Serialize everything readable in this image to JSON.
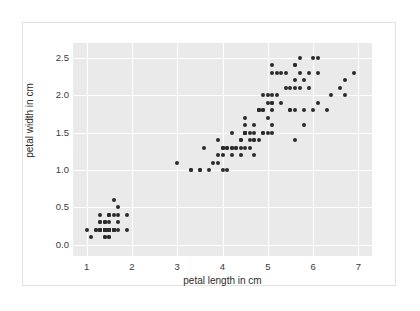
{
  "chart_data": {
    "type": "scatter",
    "title": "",
    "subtitle": "",
    "xlabel": "petal length in cm",
    "ylabel": "petal width in cm",
    "xlim": [
      0.7,
      7.3
    ],
    "ylim": [
      -0.15,
      2.7
    ],
    "xticks": [
      1,
      2,
      3,
      4,
      5,
      6,
      7
    ],
    "xtick_labels": [
      "1",
      "2",
      "3",
      "4",
      "5",
      "6",
      "7"
    ],
    "yticks": [
      0.0,
      0.5,
      1.0,
      1.5,
      2.0,
      2.5
    ],
    "ytick_labels": [
      "0.0",
      "0.5",
      "1.0",
      "1.5",
      "2.0",
      "2.5"
    ],
    "grid": true,
    "grid_color": "#ffffff",
    "plot_background": "#eaeaea",
    "figure_background": "#ffffff",
    "legend": null,
    "legend_position": "none",
    "marker_color": "#2b2b2b",
    "marker_size": 4,
    "marker_shape": "circle",
    "series": [
      {
        "name": "iris petal measurements",
        "x": [
          1.4,
          1.4,
          1.3,
          1.5,
          1.4,
          1.7,
          1.4,
          1.5,
          1.4,
          1.5,
          1.5,
          1.6,
          1.4,
          1.1,
          1.2,
          1.5,
          1.3,
          1.4,
          1.7,
          1.5,
          1.7,
          1.5,
          1.0,
          1.7,
          1.9,
          1.6,
          1.6,
          1.5,
          1.4,
          1.6,
          1.6,
          1.5,
          1.5,
          1.4,
          1.5,
          1.2,
          1.3,
          1.4,
          1.3,
          1.5,
          1.3,
          1.3,
          1.3,
          1.6,
          1.9,
          1.4,
          1.6,
          1.4,
          1.5,
          1.4,
          4.7,
          4.5,
          4.9,
          4.0,
          4.6,
          4.5,
          4.7,
          3.3,
          4.6,
          3.9,
          3.5,
          4.2,
          4.0,
          4.7,
          3.6,
          4.4,
          4.5,
          4.1,
          4.5,
          3.9,
          4.8,
          4.0,
          4.9,
          4.7,
          4.3,
          4.4,
          4.8,
          5.0,
          4.5,
          3.5,
          3.8,
          3.7,
          3.9,
          5.1,
          4.5,
          4.5,
          4.7,
          4.4,
          4.1,
          4.0,
          4.4,
          4.6,
          4.0,
          3.3,
          4.2,
          4.2,
          4.2,
          4.3,
          3.0,
          4.1,
          6.0,
          5.1,
          5.9,
          5.6,
          5.8,
          6.6,
          4.5,
          6.3,
          5.8,
          6.1,
          5.1,
          5.3,
          5.5,
          5.0,
          5.1,
          5.3,
          5.5,
          6.7,
          6.9,
          5.0,
          5.7,
          4.9,
          6.7,
          4.9,
          5.7,
          6.0,
          4.8,
          4.9,
          5.6,
          5.8,
          6.1,
          6.4,
          5.6,
          5.1,
          5.6,
          6.1,
          5.6,
          5.5,
          4.8,
          5.4,
          5.6,
          5.1,
          5.1,
          5.9,
          5.7,
          5.2,
          5.0,
          5.2,
          5.4,
          5.1
        ],
        "y": [
          0.2,
          0.2,
          0.2,
          0.2,
          0.2,
          0.4,
          0.3,
          0.2,
          0.2,
          0.1,
          0.2,
          0.2,
          0.1,
          0.1,
          0.2,
          0.4,
          0.4,
          0.3,
          0.3,
          0.3,
          0.2,
          0.4,
          0.2,
          0.5,
          0.2,
          0.2,
          0.4,
          0.2,
          0.2,
          0.2,
          0.2,
          0.4,
          0.1,
          0.2,
          0.2,
          0.2,
          0.2,
          0.1,
          0.2,
          0.2,
          0.3,
          0.3,
          0.2,
          0.6,
          0.4,
          0.3,
          0.2,
          0.2,
          0.2,
          0.2,
          1.4,
          1.5,
          1.5,
          1.3,
          1.5,
          1.3,
          1.6,
          1.0,
          1.3,
          1.4,
          1.0,
          1.5,
          1.0,
          1.4,
          1.3,
          1.4,
          1.5,
          1.0,
          1.5,
          1.1,
          1.8,
          1.3,
          1.5,
          1.2,
          1.3,
          1.4,
          1.4,
          1.7,
          1.5,
          1.0,
          1.1,
          1.0,
          1.2,
          1.6,
          1.5,
          1.6,
          1.5,
          1.3,
          1.3,
          1.3,
          1.2,
          1.4,
          1.2,
          1.0,
          1.3,
          1.2,
          1.3,
          1.3,
          1.1,
          1.3,
          2.5,
          1.9,
          2.1,
          1.8,
          2.2,
          2.1,
          1.7,
          1.8,
          1.8,
          2.5,
          2.0,
          1.9,
          2.1,
          2.0,
          2.4,
          2.3,
          1.8,
          2.2,
          2.3,
          1.5,
          2.3,
          2.0,
          2.0,
          1.8,
          2.1,
          1.8,
          1.8,
          1.8,
          2.1,
          1.6,
          1.9,
          2.0,
          2.2,
          1.5,
          1.4,
          2.3,
          2.4,
          1.8,
          1.8,
          2.1,
          2.4,
          2.3,
          1.9,
          2.3,
          2.5,
          2.3,
          1.9,
          2.0,
          2.3,
          1.8
        ]
      }
    ]
  }
}
